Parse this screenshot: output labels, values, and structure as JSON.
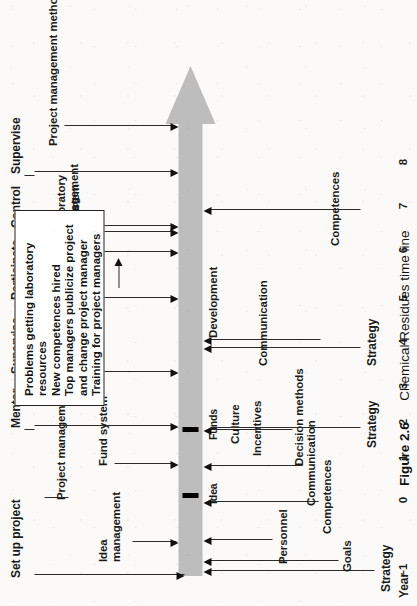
{
  "figure": {
    "number": "Figure 2.6",
    "caption": "Chemical Residues time line",
    "axis_label": "Year",
    "year_ticks": [
      "–1",
      "0",
      "1",
      "2",
      "3",
      "4",
      "5",
      "6",
      "7",
      "8"
    ]
  },
  "phases": [
    {
      "label": "Set up project"
    },
    {
      "label": "Mentor"
    },
    {
      "label": "Supervise"
    },
    {
      "label": "Participate"
    },
    {
      "label": "Control"
    },
    {
      "label": "Supervise"
    }
  ],
  "inputs_above": [
    {
      "label": "Idea management"
    },
    {
      "label": "Fund system"
    },
    {
      "label": "Project management methods"
    },
    {
      "label": "Project structure"
    },
    {
      "label": "Fund system"
    },
    {
      "label": "Laboratory management"
    },
    {
      "label": "Project management methods"
    }
  ],
  "timeline_events": [
    {
      "label": "Idea"
    },
    {
      "label": "Funds"
    },
    {
      "label": "Development"
    }
  ],
  "inputs_below": [
    {
      "label": "Goals"
    },
    {
      "label": "Strategy"
    },
    {
      "label": "Competences"
    },
    {
      "label": "Personnel"
    },
    {
      "label": "Communication"
    },
    {
      "label": "Decision methods"
    },
    {
      "label": "Incentives"
    },
    {
      "label": "Culture"
    },
    {
      "label": "Strategy"
    },
    {
      "label": "Communication"
    },
    {
      "label": "Strategy"
    },
    {
      "label": "Competences"
    }
  ],
  "note_box": {
    "lines": [
      "Problems getting laboratory",
      "resources",
      "New competences hired",
      "Top managers publicize project",
      "and change project manager",
      "Training for project managers"
    ]
  },
  "colors": {
    "timeline_arrow": "#bdbdbd",
    "ink": "#1a1a1a",
    "paper": "#fbfaf8"
  }
}
